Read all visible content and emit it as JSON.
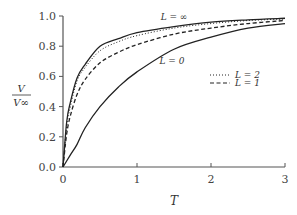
{
  "chart_data": {
    "type": "line",
    "title": "",
    "xlabel": "T",
    "ylabel": "V / V∞",
    "ylabel_num": "V",
    "ylabel_den": "V∞",
    "xlim": [
      0,
      3
    ],
    "ylim": [
      0,
      1.0
    ],
    "xticks": [
      "0",
      "1",
      "2",
      "3"
    ],
    "yticks": [
      "0.0",
      "0.2",
      "0.4",
      "0.6",
      "0.8",
      "1.0"
    ],
    "grid": false,
    "legend_position": "right-middle",
    "series": [
      {
        "name": "L = ∞",
        "style": "solid",
        "label_position": "above curve",
        "x": [
          0,
          0.05,
          0.1,
          0.19,
          0.3,
          0.5,
          0.75,
          1.0,
          1.5,
          2.0,
          2.5,
          3.0
        ],
        "y": [
          0,
          0.3,
          0.43,
          0.59,
          0.68,
          0.8,
          0.85,
          0.89,
          0.93,
          0.96,
          0.975,
          0.985
        ]
      },
      {
        "name": "L = 2",
        "style": "dotted",
        "x": [
          0,
          0.05,
          0.1,
          0.19,
          0.3,
          0.5,
          0.75,
          1.0,
          1.5,
          2.0,
          2.5,
          3.0
        ],
        "y": [
          0,
          0.27,
          0.4,
          0.57,
          0.66,
          0.77,
          0.83,
          0.87,
          0.92,
          0.95,
          0.97,
          0.98
        ]
      },
      {
        "name": "L = 1",
        "style": "dashed",
        "x": [
          0,
          0.05,
          0.1,
          0.19,
          0.3,
          0.5,
          0.75,
          1.0,
          1.5,
          2.0,
          2.5,
          3.0
        ],
        "y": [
          0,
          0.22,
          0.34,
          0.48,
          0.58,
          0.69,
          0.76,
          0.81,
          0.88,
          0.92,
          0.95,
          0.97
        ]
      },
      {
        "name": "L = 0",
        "style": "solid",
        "label_position": "below curve",
        "x": [
          0,
          0.1,
          0.19,
          0.3,
          0.5,
          0.75,
          1.0,
          1.5,
          2.0,
          2.5,
          3.0
        ],
        "y": [
          0,
          0.08,
          0.15,
          0.26,
          0.4,
          0.53,
          0.63,
          0.78,
          0.86,
          0.92,
          0.95
        ]
      }
    ],
    "annotations": [
      "L = ∞",
      "L = 0"
    ],
    "legend": [
      {
        "label": "L = 2",
        "style": "dotted"
      },
      {
        "label": "L = 1",
        "style": "dashed"
      }
    ]
  }
}
